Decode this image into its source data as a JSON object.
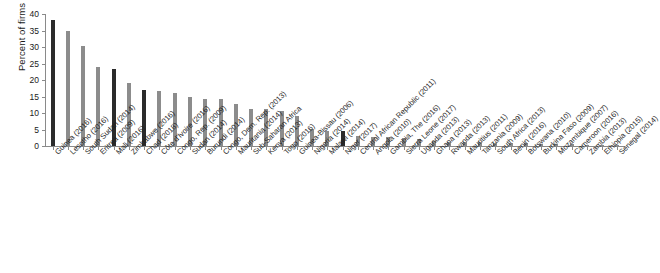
{
  "chart_data": {
    "type": "bar",
    "title": "",
    "subtitle": "",
    "xlabel": "",
    "ylabel": "Percent of firms",
    "ylim": [
      0,
      40
    ],
    "yticks": [
      0,
      5,
      10,
      15,
      20,
      25,
      30,
      35,
      40
    ],
    "ytick_labels": [
      "0",
      "5",
      "10",
      "15",
      "20",
      "25",
      "30",
      "35",
      "40"
    ],
    "grid": false,
    "legend": "none",
    "orientation": "vertical",
    "bar_color_default": "#8c8c8c",
    "bar_color_highlight": "#2b2b2b",
    "categories": [
      "Guinea (2016)",
      "Lesotho (2016)",
      "South Sudan (2014)",
      "Eritrea (2009)",
      "Mali (2016)",
      "Zimbabwe (2016)",
      "Chad (2018)",
      "Côte d'Ivoire (2016)",
      "Congo, Rep. (2009)",
      "Sudan (2014)",
      "Burundi (2014)",
      "Congo, Dem. Rep. (2013)",
      "Mauritania (2014)",
      "Sub-Saharan Africa",
      "Kenya (2013)",
      "Togo (2016)",
      "Guinea-Bissau (2006)",
      "Nigeria (2014)",
      "Malawi (2014)",
      "Niger (2017)",
      "Central African Republic (2011)",
      "Angola (2010)",
      "Gambia, The (2016)",
      "Sierra Leone (2017)",
      "Uganda (2013)",
      "Ghana (2013)",
      "Rwanda (2013)",
      "Mauritius (2011)",
      "Tanzania (2009)",
      "South Africa (2013)",
      "Benin (2016)",
      "Botswana (2010)",
      "Burkina Faso (2009)",
      "Mozambique (2007)",
      "Cameroon (2016)",
      "Zambia (2013)",
      "Ethiopia (2015)",
      "Senegal (2014)"
    ],
    "values": [
      38.3,
      34.8,
      30.3,
      24.0,
      23.2,
      19.0,
      17.0,
      16.8,
      16.0,
      14.8,
      14.2,
      14.1,
      12.7,
      11.3,
      11.2,
      10.6,
      9.0,
      5.2,
      4.7,
      4.5,
      3.0,
      2.8,
      2.6,
      2.4,
      2.2,
      1.5,
      1.3,
      1.2,
      1.1,
      1.0,
      0.9,
      0.8,
      0.7,
      0.6,
      0.5,
      0.4,
      0.3,
      0.2
    ],
    "highlighted_indices": [
      0,
      4,
      6,
      19
    ]
  }
}
